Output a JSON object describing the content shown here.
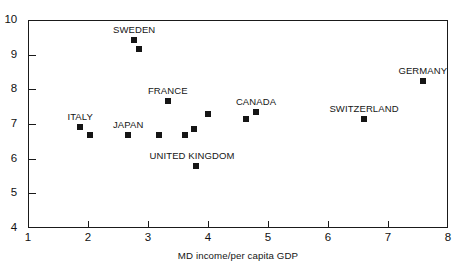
{
  "chart_data": {
    "type": "scatter",
    "title": "",
    "xlabel": "MD income/per capita GDP",
    "ylabel": "",
    "xlim": [
      1,
      8
    ],
    "ylim": [
      4,
      10
    ],
    "xticks": [
      "1",
      "2",
      "3",
      "4",
      "5",
      "6",
      "7",
      "8"
    ],
    "yticks": [
      "4",
      "5",
      "6",
      "7",
      "8",
      "9",
      "10"
    ],
    "grid": false,
    "legend": "none",
    "marker": "filled-square",
    "marker_color": "#151515",
    "points": [
      {
        "label": "SWEDEN",
        "x": 2.77,
        "y": 9.43,
        "label_dx": 0,
        "label_dy": -16,
        "labeled": true
      },
      {
        "label": "",
        "x": 2.85,
        "y": 9.15,
        "label_dx": 0,
        "label_dy": 0,
        "labeled": false
      },
      {
        "label": "GERMANY",
        "x": 7.58,
        "y": 8.23,
        "label_dx": 0,
        "label_dy": -16,
        "labeled": true
      },
      {
        "label": "FRANCE",
        "x": 3.33,
        "y": 7.66,
        "label_dx": 0,
        "label_dy": -16,
        "labeled": true
      },
      {
        "label": "CANADA",
        "x": 4.8,
        "y": 7.36,
        "label_dx": 0,
        "label_dy": -16,
        "labeled": true
      },
      {
        "label": "",
        "x": 4.0,
        "y": 7.3,
        "label_dx": 0,
        "label_dy": 0,
        "labeled": false
      },
      {
        "label": "",
        "x": 4.63,
        "y": 7.15,
        "label_dx": 0,
        "label_dy": 0,
        "labeled": false
      },
      {
        "label": "SWITZERLAND",
        "x": 6.6,
        "y": 7.15,
        "label_dx": 0,
        "label_dy": -16,
        "labeled": true
      },
      {
        "label": "ITALY",
        "x": 1.87,
        "y": 6.9,
        "label_dx": 0,
        "label_dy": -16,
        "labeled": true
      },
      {
        "label": "",
        "x": 3.77,
        "y": 6.85,
        "label_dx": 0,
        "label_dy": 0,
        "labeled": false
      },
      {
        "label": "",
        "x": 2.03,
        "y": 6.69,
        "label_dx": 0,
        "label_dy": 0,
        "labeled": false
      },
      {
        "label": "JAPAN",
        "x": 2.67,
        "y": 6.69,
        "label_dx": 0,
        "label_dy": -16,
        "labeled": true
      },
      {
        "label": "",
        "x": 3.18,
        "y": 6.69,
        "label_dx": 0,
        "label_dy": 0,
        "labeled": false
      },
      {
        "label": "",
        "x": 3.62,
        "y": 6.69,
        "label_dx": 0,
        "label_dy": 0,
        "labeled": false
      },
      {
        "label": "UNITED KINGDOM",
        "x": 3.8,
        "y": 5.79,
        "label_dx": -4,
        "label_dy": -16,
        "labeled": true
      }
    ]
  }
}
